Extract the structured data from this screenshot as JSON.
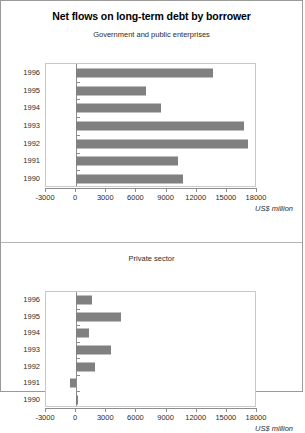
{
  "chart_data": [
    {
      "type": "bar",
      "orientation": "horizontal",
      "title": "Net flows on long-term debt by borrower",
      "subtitle": "Government and public enterprises",
      "categories": [
        "1996",
        "1995",
        "1994",
        "1993",
        "1992",
        "1991",
        "1990"
      ],
      "values": [
        13600,
        7000,
        8400,
        16700,
        17100,
        10100,
        10600
      ],
      "xlabel": "US$ million",
      "ylabel": "",
      "xlim": [
        -3000,
        18000
      ],
      "xticks": [
        -3000,
        0,
        3000,
        6000,
        9000,
        12000,
        15000,
        18000
      ],
      "xticklabels": [
        "-3000",
        "0",
        "3000",
        "6000",
        "9000",
        "12000",
        "15000",
        "18000"
      ],
      "grid": false,
      "legend": "none",
      "bar_color": "#808080"
    },
    {
      "type": "bar",
      "orientation": "horizontal",
      "title": "",
      "subtitle": "Private sector",
      "categories": [
        "1996",
        "1995",
        "1994",
        "1993",
        "1992",
        "1991",
        "1990"
      ],
      "values": [
        1600,
        4500,
        1300,
        3500,
        1900,
        -600,
        200
      ],
      "xlabel": "US$ million",
      "ylabel": "",
      "xlim": [
        -3000,
        18000
      ],
      "xticks": [
        -3000,
        0,
        3000,
        6000,
        9000,
        12000,
        15000,
        18000
      ],
      "xticklabels": [
        "-3000",
        "0",
        "3000",
        "6000",
        "9000",
        "12000",
        "15000",
        "18000"
      ],
      "grid": false,
      "legend": "none",
      "bar_color": "#808080"
    }
  ],
  "figure": {
    "title": "Net flows on long-term debt by borrower",
    "panels": [
      {
        "subtitle": "Government and public enterprises",
        "units": "US$ million"
      },
      {
        "subtitle": "Private sector",
        "units": "US$ million"
      }
    ]
  }
}
